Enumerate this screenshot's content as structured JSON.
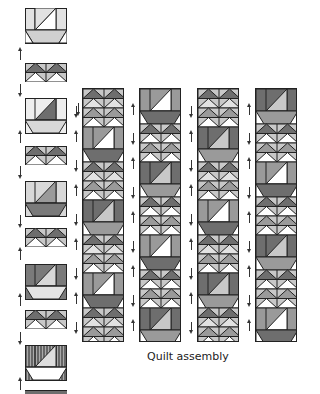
{
  "figure": {
    "caption": "Quilt assembly"
  },
  "colors": {
    "outline": "#222222",
    "dark_gray": "#6e6e6e",
    "mid_gray": "#9a9a9a",
    "light_gray": "#c8c8c8",
    "pale_gray": "#e2e2e2",
    "white": "#ffffff"
  },
  "left_column": {
    "blocks": [
      {
        "type": "sailboat",
        "sail": "light",
        "hull": "dotted-light"
      },
      {
        "type": "flying-geese-pair"
      },
      {
        "type": "sailboat",
        "sail": "dark",
        "hull": "dotted"
      },
      {
        "type": "flying-geese-pair"
      },
      {
        "type": "sailboat",
        "sail": "mid",
        "hull": "dark"
      },
      {
        "type": "flying-geese-pair"
      },
      {
        "type": "sailboat",
        "sail": "light",
        "hull": "checked"
      },
      {
        "type": "flying-geese-pair"
      },
      {
        "type": "sailboat",
        "sail": "striped",
        "hull": "white"
      },
      {
        "type": "flying-geese-pair-partial"
      }
    ],
    "arrows": [
      "up",
      "down",
      "up",
      "down",
      "up",
      "down",
      "up",
      "down",
      "up"
    ]
  },
  "assembled_columns": [
    {
      "index": 1,
      "start": "flying-geese",
      "rows": 16
    },
    {
      "index": 2,
      "start": "sailboat",
      "rows": 16
    },
    {
      "index": 3,
      "start": "flying-geese",
      "rows": 16
    },
    {
      "index": 4,
      "start": "sailboat",
      "rows": 16
    }
  ]
}
